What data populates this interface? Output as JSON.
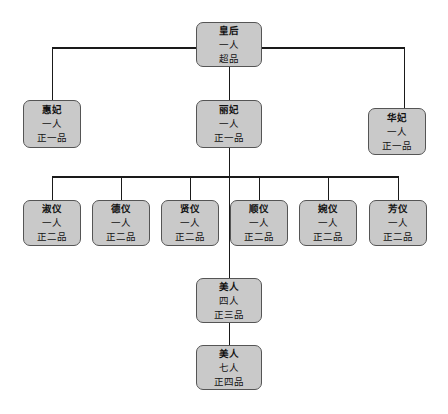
{
  "diagram": {
    "type": "org-chart",
    "colors": {
      "node_fill": "#c9c9c9",
      "node_border": "#555555",
      "line": "#1a1a1a",
      "background": "#ffffff"
    },
    "nodes": {
      "empress": {
        "title": "皇后",
        "count": "一人",
        "rank": "超品"
      },
      "huifei": {
        "title": "惠妃",
        "count": "一人",
        "rank": "正一品"
      },
      "lifei": {
        "title": "丽妃",
        "count": "一人",
        "rank": "正一品"
      },
      "huafei": {
        "title": "华妃",
        "count": "一人",
        "rank": "正一品"
      },
      "shuyi": {
        "title": "淑仪",
        "count": "一人",
        "rank": "正二品"
      },
      "deyi": {
        "title": "德仪",
        "count": "一人",
        "rank": "正二品"
      },
      "xianyi": {
        "title": "贤仪",
        "count": "一人",
        "rank": "正二品"
      },
      "shunyi": {
        "title": "顺仪",
        "count": "一人",
        "rank": "正二品"
      },
      "wanyi": {
        "title": "婉仪",
        "count": "一人",
        "rank": "正二品"
      },
      "fangyi": {
        "title": "芳仪",
        "count": "一人",
        "rank": "正二品"
      },
      "meiren4": {
        "title": "美人",
        "count": "四人",
        "rank": "正三品"
      },
      "meiren7": {
        "title": "美人",
        "count": "七人",
        "rank": "正四品"
      }
    },
    "edges": [
      [
        "empress",
        "huifei"
      ],
      [
        "empress",
        "lifei"
      ],
      [
        "empress",
        "huafei"
      ],
      [
        "lifei",
        "shuyi"
      ],
      [
        "lifei",
        "deyi"
      ],
      [
        "lifei",
        "xianyi"
      ],
      [
        "lifei",
        "shunyi"
      ],
      [
        "lifei",
        "wanyi"
      ],
      [
        "lifei",
        "fangyi"
      ],
      [
        "lifei",
        "meiren4"
      ],
      [
        "meiren4",
        "meiren7"
      ]
    ]
  }
}
